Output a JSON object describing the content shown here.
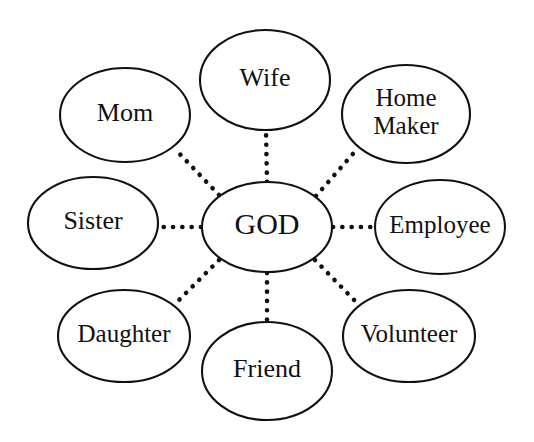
{
  "diagram": {
    "type": "hub-and-spoke",
    "background_color": "#ffffff",
    "stroke_color": "#111111",
    "center": {
      "id": "god",
      "label": "GOD",
      "cx": 267,
      "cy": 227,
      "rx": 65,
      "ry": 45,
      "font_size": 30
    },
    "satellites": [
      {
        "id": "wife",
        "label": "Wife",
        "lines": [
          "Wife"
        ],
        "cx": 265,
        "cy": 80,
        "rx": 65,
        "ry": 50,
        "font_size": 26
      },
      {
        "id": "home-maker",
        "label": "Home Maker",
        "lines": [
          "Home",
          "Maker"
        ],
        "cx": 406,
        "cy": 114,
        "rx": 64,
        "ry": 49,
        "font_size": 25
      },
      {
        "id": "employee",
        "label": "Employee",
        "lines": [
          "Employee"
        ],
        "cx": 440,
        "cy": 227,
        "rx": 65,
        "ry": 47,
        "font_size": 25
      },
      {
        "id": "volunteer",
        "label": "Volunteer",
        "lines": [
          "Volunteer"
        ],
        "cx": 409,
        "cy": 336,
        "rx": 66,
        "ry": 46,
        "font_size": 25
      },
      {
        "id": "friend",
        "label": "Friend",
        "lines": [
          "Friend"
        ],
        "cx": 267,
        "cy": 371,
        "rx": 65,
        "ry": 49,
        "font_size": 26
      },
      {
        "id": "daughter",
        "label": "Daughter",
        "lines": [
          "Daughter"
        ],
        "cx": 124,
        "cy": 336,
        "rx": 66,
        "ry": 46,
        "font_size": 25
      },
      {
        "id": "sister",
        "label": "Sister",
        "lines": [
          "Sister"
        ],
        "cx": 93,
        "cy": 223,
        "rx": 65,
        "ry": 46,
        "font_size": 26
      },
      {
        "id": "mom",
        "label": "Mom",
        "lines": [
          "Mom"
        ],
        "cx": 125,
        "cy": 115,
        "rx": 65,
        "ry": 47,
        "font_size": 26
      }
    ],
    "connectors": [
      {
        "id": "god-to-wife",
        "from": "god",
        "to": "wife",
        "x1": 267,
        "y1": 182,
        "x2": 266,
        "y2": 131,
        "style": "dotted"
      },
      {
        "id": "god-to-home-maker",
        "from": "god",
        "to": "home-maker",
        "x1": 316,
        "y1": 196,
        "x2": 358,
        "y2": 148,
        "style": "dotted"
      },
      {
        "id": "god-to-employee",
        "from": "god",
        "to": "employee",
        "x1": 333,
        "y1": 227,
        "x2": 374,
        "y2": 227,
        "style": "dotted"
      },
      {
        "id": "god-to-volunteer",
        "from": "god",
        "to": "volunteer",
        "x1": 315,
        "y1": 260,
        "x2": 358,
        "y2": 304,
        "style": "dotted"
      },
      {
        "id": "god-to-friend",
        "from": "god",
        "to": "friend",
        "x1": 267,
        "y1": 273,
        "x2": 267,
        "y2": 322,
        "style": "dotted"
      },
      {
        "id": "god-to-daughter",
        "from": "god",
        "to": "daughter",
        "x1": 219,
        "y1": 260,
        "x2": 176,
        "y2": 303,
        "style": "dotted"
      },
      {
        "id": "god-to-sister",
        "from": "god",
        "to": "sister",
        "x1": 201,
        "y1": 227,
        "x2": 159,
        "y2": 227,
        "style": "dotted"
      },
      {
        "id": "god-to-mom",
        "from": "god",
        "to": "mom",
        "x1": 219,
        "y1": 195,
        "x2": 176,
        "y2": 150,
        "style": "dotted"
      }
    ]
  }
}
